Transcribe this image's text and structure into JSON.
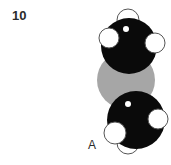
{
  "figure": {
    "number": "10",
    "panel_label": "A",
    "colors": {
      "central_atom": "#a6a6a6",
      "heavy_atom": "#0a0a0a",
      "light_atom": "#ffffff",
      "outline": "#555555"
    },
    "atoms": [
      {
        "id": "gray-center",
        "cx": 126,
        "cy": 80,
        "r": 29,
        "color": "#a6a6a6"
      },
      {
        "id": "top-black",
        "cx": 129,
        "cy": 46,
        "r": 28,
        "color": "#0a0a0a"
      },
      {
        "id": "top-white-top",
        "cx": 128,
        "cy": 20,
        "r": 11,
        "color": "#ffffff"
      },
      {
        "id": "top-white-left",
        "cx": 109,
        "cy": 38,
        "r": 10,
        "color": "#ffffff"
      },
      {
        "id": "top-white-right",
        "cx": 155,
        "cy": 43,
        "r": 10,
        "color": "#ffffff"
      },
      {
        "id": "bottom-black",
        "cx": 136,
        "cy": 120,
        "r": 29,
        "color": "#0a0a0a"
      },
      {
        "id": "bottom-white-bottom",
        "cx": 128,
        "cy": 143,
        "r": 11,
        "color": "#ffffff"
      },
      {
        "id": "bottom-white-left",
        "cx": 115,
        "cy": 133,
        "r": 11,
        "color": "#ffffff"
      },
      {
        "id": "bottom-white-right",
        "cx": 158,
        "cy": 119,
        "r": 10,
        "color": "#ffffff"
      }
    ]
  }
}
